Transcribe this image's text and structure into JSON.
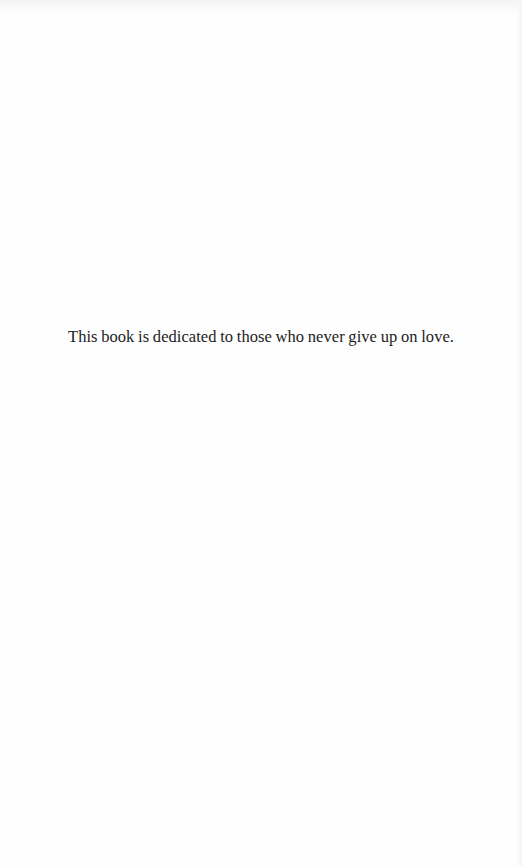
{
  "page": {
    "type": "dedication",
    "dedication_text": "This book is dedicated to those who never give up on love."
  },
  "colors": {
    "background": "#fefefe",
    "text": "#222222"
  }
}
